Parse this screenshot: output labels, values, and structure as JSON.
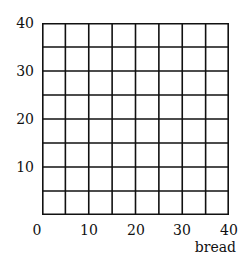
{
  "chart_data": {
    "type": "scatter",
    "title": "",
    "xlabel": "bread",
    "ylabel": "",
    "xlim": [
      0,
      40
    ],
    "ylim": [
      0,
      40
    ],
    "x_ticks": [
      "0",
      "10",
      "20",
      "30",
      "40"
    ],
    "y_ticks": [
      "10",
      "20",
      "30",
      "40"
    ],
    "grid": true,
    "grid_step": 5,
    "series": [],
    "legend": null
  },
  "labels": {
    "x0": "0",
    "x10": "10",
    "x20": "20",
    "x30": "30",
    "x40": "40",
    "y10": "10",
    "y20": "20",
    "y30": "30",
    "y40": "40",
    "xaxis": "bread"
  }
}
